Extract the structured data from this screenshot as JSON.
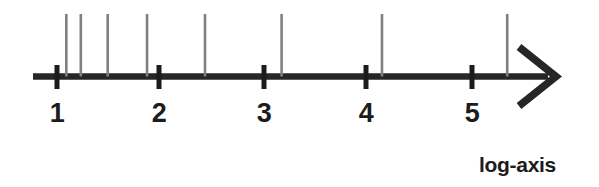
{
  "figure": {
    "background_color": "#ffffff",
    "width": 599,
    "height": 187,
    "caption": "log-axis"
  },
  "axis": {
    "line_color": "#262626",
    "tick_color": "#1c1c1c",
    "label_color": "#1c1c1c",
    "arrow_head": "chevron-right",
    "tick_labels": [
      "1",
      "2",
      "3",
      "4",
      "5"
    ]
  },
  "rug": {
    "line_color": "#808080"
  },
  "chart_data": {
    "type": "scatter",
    "title": "",
    "subtitle": "",
    "xlabel": "log-axis",
    "ylabel": "",
    "xscale": "log",
    "grid": false,
    "legend": null,
    "axis_style": "number-line-with-arrow",
    "xticks": [
      1,
      2,
      3,
      4,
      5
    ],
    "xticklabels": [
      "1",
      "2",
      "3",
      "4",
      "5"
    ],
    "xlim": [
      0.75,
      5.9
    ],
    "series": [
      {
        "name": "observations",
        "marker": "vertical-rug-line",
        "color": "#808080",
        "x": [
          1.09,
          1.23,
          1.49,
          1.87,
          2.43,
          3.17,
          4.14,
          5.35
        ]
      }
    ],
    "annotations": [
      {
        "text": "log-axis",
        "position": "bottom-right"
      }
    ]
  }
}
